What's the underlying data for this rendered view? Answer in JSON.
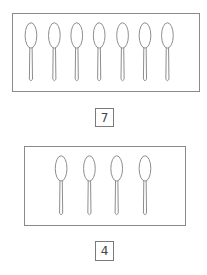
{
  "groups": [
    {
      "name": "top",
      "spoon_count": 7,
      "label": "7",
      "panel": {
        "x": 12,
        "y": 13,
        "w": 188,
        "h": 79
      },
      "spoon_xs": [
        24,
        48,
        71,
        94,
        118,
        141,
        164
      ],
      "numbox": {
        "x": 95,
        "y": 108,
        "w": 19,
        "h": 19
      }
    },
    {
      "name": "bottom",
      "spoon_count": 4,
      "label": "4",
      "panel": {
        "x": 24,
        "y": 146,
        "w": 162,
        "h": 80
      },
      "spoon_xs": [
        55,
        84,
        112,
        141
      ],
      "numbox": {
        "x": 95,
        "y": 241,
        "w": 19,
        "h": 20
      }
    }
  ],
  "colors": {
    "stroke": "#8a8a8a",
    "text": "#444444"
  },
  "icons": {
    "item": "spoon-icon"
  }
}
